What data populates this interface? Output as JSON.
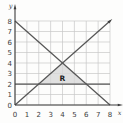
{
  "figure": {
    "xlabel": "x",
    "ylabel": "y",
    "region_label": "R"
  },
  "chart_data": {
    "type": "line",
    "title": "",
    "xlabel": "x",
    "ylabel": "y",
    "xlim": [
      0,
      8
    ],
    "ylim": [
      0,
      8
    ],
    "xticks": [
      0,
      1,
      2,
      3,
      4,
      5,
      6,
      7,
      8
    ],
    "yticks": [
      0,
      1,
      2,
      3,
      4,
      5,
      6,
      7,
      8
    ],
    "grid": true,
    "legend": false,
    "series": [
      {
        "name": "y = x",
        "points": [
          [
            0,
            0
          ],
          [
            8,
            8
          ]
        ],
        "arrow_end": true
      },
      {
        "name": "y = 8 - x",
        "points": [
          [
            0,
            8
          ],
          [
            8,
            0
          ]
        ],
        "arrow_end": false
      },
      {
        "name": "y = 2",
        "points": [
          [
            0,
            2
          ],
          [
            8,
            2
          ]
        ],
        "arrow_end": false
      }
    ],
    "region": {
      "label": "R",
      "vertices": [
        [
          2,
          2
        ],
        [
          6,
          2
        ],
        [
          4,
          4
        ]
      ],
      "label_at": [
        4,
        2.55
      ]
    },
    "colors": {
      "background": "#fdfdfc",
      "grid": "#c7c7c7",
      "line": "#565656",
      "axis": "#3c3c3c",
      "text": "#3c3c3c",
      "region_fill": "#d8d8d8"
    }
  }
}
